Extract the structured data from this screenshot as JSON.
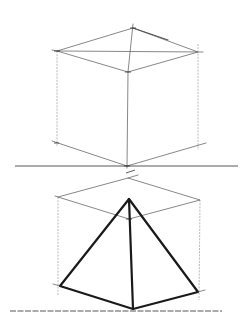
{
  "figure": {
    "colors": {
      "background": "#ffffff",
      "construction_line": "#555555",
      "outline": "#1a1a1a"
    }
  },
  "cube": {
    "top": {
      "left": [
        57,
        51
      ],
      "back": [
        133,
        28
      ],
      "right": [
        198,
        52
      ],
      "front": [
        128,
        72
      ]
    },
    "bottom": {
      "left": [
        57,
        143
      ],
      "front": [
        127,
        166
      ],
      "right": [
        198,
        145
      ]
    },
    "ground_line": {
      "x1": 15,
      "y1": 166,
      "x2": 238,
      "y2": 166
    }
  },
  "pyramid": {
    "box_top": {
      "left": [
        58,
        197
      ],
      "back": [
        128,
        178
      ],
      "right": [
        200,
        200
      ],
      "front": [
        129,
        219
      ]
    },
    "apex": [
      129,
      199
    ],
    "base": {
      "left": [
        60,
        286
      ],
      "front": [
        133,
        309
      ],
      "right": [
        198,
        292
      ]
    },
    "ground_line": {
      "x1": 10,
      "y1": 311,
      "x2": 222,
      "y2": 311
    }
  }
}
